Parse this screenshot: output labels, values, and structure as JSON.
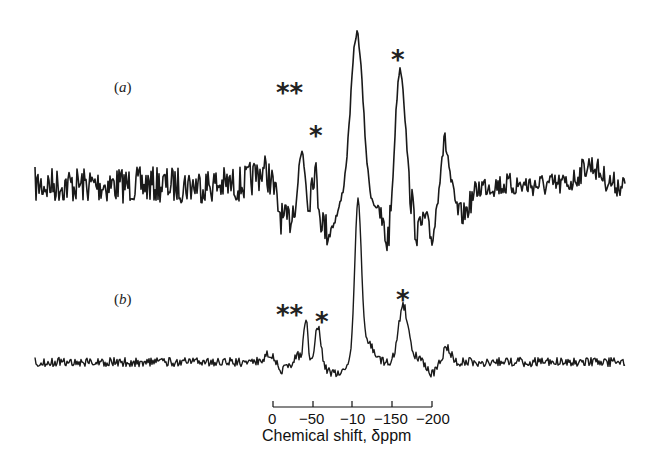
{
  "chart_data": {
    "type": "line",
    "title": "",
    "xlabel": "Chemical shift, δppm",
    "ylabel": "",
    "x_ticks": [
      "0",
      "−50",
      "−10",
      "−150",
      "−200"
    ],
    "xlim": [
      0,
      -200
    ],
    "grid": false,
    "series": [
      {
        "name": "(a)",
        "label": "(a)",
        "peaks": [
          {
            "shift": -75,
            "marker": "**",
            "relative_height": 0.55
          },
          {
            "shift": -80,
            "marker": "*",
            "relative_height": 0.35
          },
          {
            "shift": -107,
            "marker": "",
            "relative_height": 1.0
          },
          {
            "shift": -160,
            "marker": "*",
            "relative_height": 0.75
          }
        ],
        "noise": "high"
      },
      {
        "name": "(b)",
        "label": "(b)",
        "peaks": [
          {
            "shift": -82,
            "marker": "**",
            "relative_height": 0.3
          },
          {
            "shift": -89,
            "marker": "*",
            "relative_height": 0.25
          },
          {
            "shift": -108,
            "marker": "",
            "relative_height": 1.0
          },
          {
            "shift": -163,
            "marker": "*",
            "relative_height": 0.38
          }
        ],
        "noise": "low"
      }
    ],
    "annotations": [
      "**",
      "*",
      "*",
      "**",
      "*",
      "*"
    ]
  },
  "labels": {
    "a": "a",
    "b": "b"
  },
  "axis": {
    "ticks": [
      "0",
      "−50",
      "−10",
      "−150",
      "−200"
    ],
    "title": "Chemical shift,  δppm"
  },
  "markers": {
    "double": "**",
    "single": "*"
  }
}
